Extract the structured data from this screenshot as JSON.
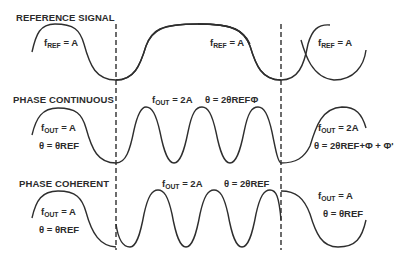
{
  "diagram": {
    "sections": [
      {
        "title": "REFERENCE SIGNAL",
        "labels": [
          {
            "f": "f",
            "sub": "REF",
            "eq": " = A"
          },
          {
            "f": "f",
            "sub": "REF",
            "eq": " = A"
          },
          {
            "f": "f",
            "sub": "REF",
            "eq": " = A"
          }
        ]
      },
      {
        "title": "PHASE CONTINUOUS",
        "labels": [
          {
            "f": "f",
            "sub": "OUT",
            "eq": " = A",
            "theta": "θ = θREF"
          },
          {
            "f": "f",
            "sub": "OUT",
            "eq": " = 2A",
            "theta": "θ = 2θREFΦ"
          },
          {
            "f": "f",
            "sub": "OUT",
            "eq": " = 2A",
            "theta": "θ = 2θREF+Φ + Φ'"
          }
        ]
      },
      {
        "title": "PHASE COHERENT",
        "labels": [
          {
            "f": "f",
            "sub": "OUT",
            "eq": " = A",
            "theta": "θ = θREF"
          },
          {
            "f": "f",
            "sub": "OUT",
            "eq": " = 2A",
            "theta": "θ = 2θREF"
          },
          {
            "f": "f",
            "sub": "OUT",
            "eq": " = A",
            "theta": "θ = θREF"
          }
        ]
      }
    ],
    "colors": {
      "line": "#2e2e2e",
      "text": "#2b2b2b",
      "background": "#ffffff"
    }
  }
}
